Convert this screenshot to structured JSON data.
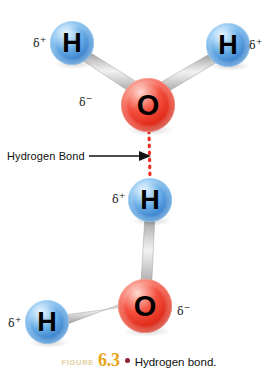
{
  "figure": {
    "background_color": "#ffffff"
  },
  "caption": {
    "figure_word": "Figure",
    "figure_number": "6.3",
    "bullet": "•",
    "text": "Hydrogen bond.",
    "word_color": "#e3cfa0",
    "number_color": "#e8a517",
    "bullet_color": "#8c2237",
    "text_color": "#111111"
  },
  "callout": {
    "label": "Hydrogen Bond",
    "arrow_color": "#111111"
  },
  "colors": {
    "hydrogen_sphere": "#5ba3e0",
    "hydrogen_sphere_light": "#cfe6f9",
    "hydrogen_sphere_dark": "#2a6fb5",
    "oxygen_sphere": "#ef3b2c",
    "oxygen_sphere_light": "#fbbdb4",
    "oxygen_sphere_dark": "#b81d12",
    "bond_gray": "#b9b9b9",
    "bond_gray_light": "#ededed",
    "bond_gray_dark": "#8c8c8c",
    "hydrogen_bond_dotted": "#ee3124",
    "atom_letter": "#000000"
  },
  "atoms": [
    {
      "id": "h-top-left",
      "element": "H",
      "cx": 72,
      "cy": 43,
      "r": 22,
      "charge": "δ",
      "charge_sign": "+"
    },
    {
      "id": "h-top-right",
      "element": "H",
      "cx": 228,
      "cy": 45,
      "r": 22,
      "charge": "δ",
      "charge_sign": "+"
    },
    {
      "id": "o-top",
      "element": "O",
      "cx": 148,
      "cy": 105,
      "r": 27,
      "charge": "δ",
      "charge_sign": "−"
    },
    {
      "id": "h-middle",
      "element": "H",
      "cx": 150,
      "cy": 200,
      "r": 22,
      "charge": "δ",
      "charge_sign": "+"
    },
    {
      "id": "o-bottom",
      "element": "O",
      "cx": 145,
      "cy": 306,
      "r": 27,
      "charge": "δ",
      "charge_sign": "−"
    },
    {
      "id": "h-bottom-left",
      "element": "H",
      "cx": 47,
      "cy": 322,
      "r": 22,
      "charge": "δ",
      "charge_sign": "+"
    }
  ],
  "atom_labels": {
    "h_top_left": "H",
    "h_top_right": "H",
    "o_top": "O",
    "h_middle": "H",
    "o_bottom": "O",
    "h_bottom_left": "H"
  },
  "delta_labels": {
    "h_top_left": "δ",
    "h_top_left_sign": "+",
    "h_top_right": "δ",
    "h_top_right_sign": "+",
    "o_top": "δ",
    "o_top_sign": "−",
    "h_middle": "δ",
    "h_middle_sign": "+",
    "o_bottom": "δ",
    "o_bottom_sign": "−",
    "h_bottom_left": "δ",
    "h_bottom_left_sign": "+"
  },
  "bonds": [
    {
      "id": "bond-o-top-h-left",
      "type": "covalent",
      "from": "o-top",
      "to": "h-top-left"
    },
    {
      "id": "bond-o-top-h-right",
      "type": "covalent",
      "from": "o-top",
      "to": "h-top-right"
    },
    {
      "id": "bond-h-middle-o-bottom",
      "type": "covalent",
      "from": "h-middle",
      "to": "o-bottom"
    },
    {
      "id": "bond-o-bottom-h-left",
      "type": "covalent",
      "from": "o-bottom",
      "to": "h-bottom-left"
    },
    {
      "id": "bond-hydrogen",
      "type": "hydrogen",
      "from": "o-top",
      "to": "h-middle"
    }
  ]
}
